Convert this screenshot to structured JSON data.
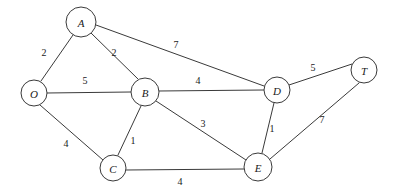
{
  "diagram": {
    "type": "node-link-graph",
    "directed": false,
    "weighted": true,
    "background_color": "#ffffff",
    "stroke_color": "#3a3a3a",
    "text_color": "#1a1a1a"
  },
  "nodes": [
    {
      "id": "O",
      "label": "O",
      "cx": 34,
      "cy": 93,
      "r": 13
    },
    {
      "id": "A",
      "label": "A",
      "cx": 81,
      "cy": 22,
      "r": 15
    },
    {
      "id": "B",
      "label": "B",
      "cx": 145,
      "cy": 92,
      "r": 14
    },
    {
      "id": "C",
      "label": "C",
      "cx": 113,
      "cy": 168,
      "r": 13
    },
    {
      "id": "D",
      "label": "D",
      "cx": 277,
      "cy": 90,
      "r": 13
    },
    {
      "id": "E",
      "label": "E",
      "cx": 258,
      "cy": 167,
      "r": 14
    },
    {
      "id": "T",
      "label": "T",
      "cx": 364,
      "cy": 70,
      "r": 13
    }
  ],
  "edges": [
    {
      "id": "edge-O-A",
      "source": "O",
      "target": "A",
      "weight": "2",
      "x1": 41,
      "y1": 81,
      "x2": 73,
      "y2": 35,
      "lx": 44,
      "ly": 52
    },
    {
      "id": "edge-O-B",
      "source": "O",
      "target": "B",
      "weight": "5",
      "x1": 47,
      "y1": 93,
      "x2": 131,
      "y2": 92,
      "lx": 85,
      "ly": 80
    },
    {
      "id": "edge-O-C",
      "source": "O",
      "target": "C",
      "weight": "4",
      "x1": 40,
      "y1": 105,
      "x2": 103,
      "y2": 160,
      "lx": 66,
      "ly": 143
    },
    {
      "id": "edge-A-B",
      "source": "A",
      "target": "B",
      "weight": "2",
      "x1": 91,
      "y1": 33,
      "x2": 138,
      "y2": 79,
      "lx": 114,
      "ly": 52
    },
    {
      "id": "edge-A-D",
      "source": "A",
      "target": "D",
      "weight": "7",
      "x1": 96,
      "y1": 25,
      "x2": 264,
      "y2": 86,
      "lx": 176,
      "ly": 44
    },
    {
      "id": "edge-B-D",
      "source": "B",
      "target": "D",
      "weight": "4",
      "x1": 159,
      "y1": 91,
      "x2": 264,
      "y2": 90,
      "lx": 198,
      "ly": 80
    },
    {
      "id": "edge-B-C",
      "source": "B",
      "target": "C",
      "weight": "1",
      "x1": 141,
      "y1": 106,
      "x2": 118,
      "y2": 155,
      "lx": 133,
      "ly": 140
    },
    {
      "id": "edge-B-E",
      "source": "B",
      "target": "E",
      "weight": "3",
      "x1": 156,
      "y1": 101,
      "x2": 246,
      "y2": 160,
      "lx": 203,
      "ly": 123
    },
    {
      "id": "edge-C-E",
      "source": "C",
      "target": "E",
      "weight": "4",
      "x1": 126,
      "y1": 170,
      "x2": 244,
      "y2": 169,
      "lx": 180,
      "ly": 181
    },
    {
      "id": "edge-D-E",
      "source": "D",
      "target": "E",
      "weight": "1",
      "x1": 274,
      "y1": 103,
      "x2": 262,
      "y2": 153,
      "lx": 272,
      "ly": 128
    },
    {
      "id": "edge-D-T",
      "source": "D",
      "target": "T",
      "weight": "5",
      "x1": 289,
      "y1": 85,
      "x2": 352,
      "y2": 64,
      "lx": 313,
      "ly": 67
    },
    {
      "id": "edge-E-T",
      "source": "E",
      "target": "T",
      "weight": "7",
      "x1": 270,
      "y1": 159,
      "x2": 359,
      "y2": 83,
      "lx": 322,
      "ly": 119
    }
  ]
}
